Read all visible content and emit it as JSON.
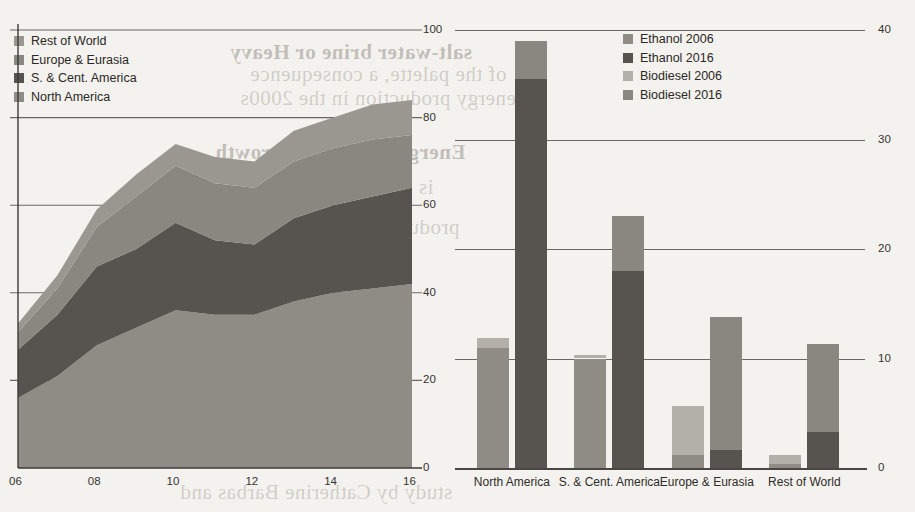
{
  "page": {
    "background_color": "#f4f2ee",
    "ghost_text": [
      {
        "text": "salt-water brine or Heavy",
        "x": 230,
        "y": 40
      },
      {
        "text": "of the palette, a consequence",
        "x": 250,
        "y": 62
      },
      {
        "text": "energy production in the 2000s",
        "x": 240,
        "y": 86
      },
      {
        "text": "Energy production growth",
        "x": 215,
        "y": 140
      },
      {
        "text": "is for lifting of salt",
        "x": 265,
        "y": 175
      },
      {
        "text": "production or sulf",
        "x": 300,
        "y": 215
      },
      {
        "text": "Energy",
        "x": 330,
        "y": 252
      },
      {
        "text": "study by Catherine Barbas and",
        "x": 180,
        "y": 480
      }
    ]
  },
  "left_chart": {
    "legend": {
      "items": [
        {
          "label": "Rest of World",
          "color": "#9a9791"
        },
        {
          "label": "Europe & Eurasia",
          "color": "#8a8781"
        },
        {
          "label": "S. & Cent. America",
          "color": "#57544f"
        },
        {
          "label": "North America",
          "color": "#8f8c86"
        }
      ]
    },
    "y_ticks": [
      "100",
      "80",
      "60",
      "40",
      "20",
      "0"
    ],
    "x_ticks": [
      "06",
      "08",
      "10",
      "12",
      "14",
      "16"
    ]
  },
  "right_chart": {
    "legend": {
      "items": [
        {
          "label": "Ethanol 2006",
          "color": "#8f8c86"
        },
        {
          "label": "Ethanol 2016",
          "color": "#57544f"
        },
        {
          "label": "Biodiesel 2006",
          "color": "#b3b0aa"
        },
        {
          "label": "Biodiesel 2016",
          "color": "#8a8781"
        }
      ]
    },
    "y_ticks": [
      "40",
      "30",
      "20",
      "10",
      "0"
    ],
    "x_ticks": [
      "North America",
      "S. & Cent. America",
      "Europe & Eurasia",
      "Rest of World"
    ]
  },
  "chart_data": [
    {
      "type": "area",
      "title": "",
      "stacked": true,
      "xlabel": "",
      "ylabel": "",
      "x": [
        2006,
        2007,
        2008,
        2009,
        2010,
        2011,
        2012,
        2013,
        2014,
        2015,
        2016
      ],
      "tick_labels": [
        "06",
        "08",
        "10",
        "12",
        "14",
        "16"
      ],
      "ylim": [
        0,
        100
      ],
      "yticks": [
        0,
        20,
        40,
        60,
        80,
        100
      ],
      "grid": true,
      "legend_position": "top-left",
      "series": [
        {
          "name": "North America",
          "color": "#8f8c86",
          "values": [
            16,
            21,
            28,
            32,
            36,
            35,
            35,
            38,
            40,
            41,
            42
          ]
        },
        {
          "name": "S. & Cent. America",
          "color": "#57544f",
          "values": [
            11,
            14,
            18,
            18,
            20,
            17,
            16,
            19,
            20,
            21,
            22
          ]
        },
        {
          "name": "Europe & Eurasia",
          "color": "#8a8781",
          "values": [
            4,
            6,
            9,
            12,
            13,
            13,
            13,
            13,
            13,
            13,
            12
          ]
        },
        {
          "name": "Rest of World",
          "color": "#9a9791",
          "values": [
            2,
            3,
            4,
            5,
            5,
            6,
            6,
            7,
            7,
            8,
            8
          ]
        }
      ],
      "totals": [
        33,
        44,
        59,
        67,
        74,
        71,
        70,
        77,
        80,
        83,
        84
      ]
    },
    {
      "type": "bar",
      "title": "",
      "stacked": true,
      "grouped": true,
      "xlabel": "",
      "ylabel": "",
      "ylim": [
        0,
        40
      ],
      "yticks": [
        0,
        10,
        20,
        30,
        40
      ],
      "axis_side": "right",
      "grid": true,
      "legend_position": "top-right",
      "categories": [
        "North America",
        "S. & Cent. America",
        "Europe & Eurasia",
        "Rest of World"
      ],
      "groups": [
        {
          "year": "2006",
          "series": [
            {
              "name": "Ethanol 2006",
              "color": "#8f8c86",
              "values": [
                11.0,
                10.0,
                1.2,
                0.4
              ]
            },
            {
              "name": "Biodiesel 2006",
              "color": "#b3b0aa",
              "values": [
                0.9,
                0.3,
                4.5,
                0.8
              ]
            }
          ]
        },
        {
          "year": "2016",
          "series": [
            {
              "name": "Ethanol 2016",
              "color": "#57544f",
              "values": [
                35.5,
                18.0,
                1.6,
                3.3
              ]
            },
            {
              "name": "Biodiesel 2016",
              "color": "#8a8781",
              "values": [
                3.5,
                5.0,
                12.2,
                8.0
              ]
            }
          ]
        }
      ]
    }
  ]
}
